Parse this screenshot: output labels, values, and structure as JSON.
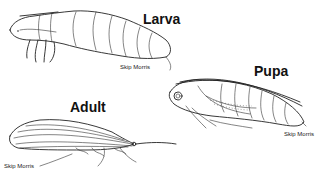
{
  "figure": {
    "stages": [
      {
        "id": "larva",
        "label": "Larva",
        "credit": "Skip Morris"
      },
      {
        "id": "pupa",
        "label": "Pupa",
        "credit": "Skip Morris"
      },
      {
        "id": "adult",
        "label": "Adult",
        "credit": "Skip Morris"
      }
    ],
    "colors": {
      "line": "#222222",
      "background": "#ffffff"
    }
  }
}
